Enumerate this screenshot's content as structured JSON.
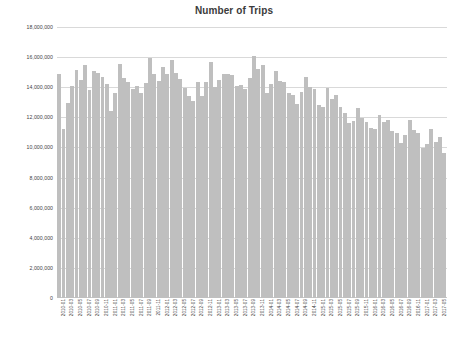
{
  "chart_data": {
    "type": "bar",
    "title": "Number of Trips",
    "xlabel": "",
    "ylabel": "",
    "ylim": [
      0,
      18000000
    ],
    "grid": true,
    "legend": null,
    "y_ticks": [
      "18,000,000",
      "16,000,000",
      "14,000,000",
      "12,000,000",
      "10,000,000",
      "8,000,000",
      "6,000,000",
      "4,000,000",
      "2,000,000",
      "0"
    ],
    "y_tick_values": [
      18000000,
      16000000,
      14000000,
      12000000,
      10000000,
      8000000,
      6000000,
      4000000,
      2000000,
      0
    ],
    "x_tick_labels": [
      "2010-01",
      "2010-03",
      "2010-05",
      "2010-07",
      "2010-09",
      "2010-11",
      "2011-01",
      "2011-03",
      "2011-05",
      "2011-07",
      "2011-09",
      "2011-11",
      "2012-01",
      "2012-03",
      "2012-05",
      "2012-07",
      "2012-09",
      "2012-11",
      "2013-01",
      "2013-03",
      "2013-05",
      "2013-07",
      "2013-09",
      "2013-11",
      "2014-01",
      "2014-03",
      "2014-05",
      "2014-07",
      "2014-09",
      "2014-11",
      "2015-01",
      "2015-03",
      "2015-05",
      "2015-07",
      "2015-09",
      "2015-11",
      "2016-01",
      "2016-03",
      "2016-05",
      "2016-07",
      "2016-09",
      "2016-11",
      "2017-01",
      "2017-03",
      "2017-05"
    ],
    "x_tick_interval_months": 2,
    "categories": [
      "2010-01",
      "2010-02",
      "2010-03",
      "2010-04",
      "2010-05",
      "2010-06",
      "2010-07",
      "2010-08",
      "2010-09",
      "2010-10",
      "2010-11",
      "2010-12",
      "2011-01",
      "2011-02",
      "2011-03",
      "2011-04",
      "2011-05",
      "2011-06",
      "2011-07",
      "2011-08",
      "2011-09",
      "2011-10",
      "2011-11",
      "2011-12",
      "2012-01",
      "2012-02",
      "2012-03",
      "2012-04",
      "2012-05",
      "2012-06",
      "2012-07",
      "2012-08",
      "2012-09",
      "2012-10",
      "2012-11",
      "2012-12",
      "2013-01",
      "2013-02",
      "2013-03",
      "2013-04",
      "2013-05",
      "2013-06",
      "2013-07",
      "2013-08",
      "2013-09",
      "2013-10",
      "2013-11",
      "2013-12",
      "2014-01",
      "2014-02",
      "2014-03",
      "2014-04",
      "2014-05",
      "2014-06",
      "2014-07",
      "2014-08",
      "2014-09",
      "2014-10",
      "2014-11",
      "2014-12",
      "2015-01",
      "2015-02",
      "2015-03",
      "2015-04",
      "2015-05",
      "2015-06",
      "2015-07",
      "2015-08",
      "2015-09",
      "2015-10",
      "2015-11",
      "2015-12",
      "2016-01",
      "2016-02",
      "2016-03",
      "2016-04",
      "2016-05",
      "2016-06",
      "2016-07",
      "2016-08",
      "2016-09",
      "2016-10",
      "2016-11",
      "2016-12",
      "2017-01",
      "2017-02",
      "2017-03",
      "2017-04",
      "2017-05",
      "2017-06"
    ],
    "values": [
      14900000,
      11200000,
      12950000,
      14050000,
      15150000,
      14500000,
      15500000,
      13800000,
      15050000,
      14950000,
      14650000,
      14200000,
      12450000,
      13650000,
      15550000,
      14600000,
      14350000,
      13900000,
      14050000,
      13650000,
      14250000,
      15950000,
      14900000,
      14400000,
      15350000,
      14900000,
      15800000,
      14950000,
      14550000,
      13950000,
      13400000,
      13100000,
      14350000,
      13400000,
      14350000,
      15700000,
      14000000,
      14450000,
      14900000,
      14900000,
      14800000,
      14100000,
      14150000,
      13850000,
      14600000,
      16050000,
      15200000,
      15450000,
      13600000,
      14200000,
      15050000,
      14400000,
      14350000,
      13650000,
      13500000,
      12900000,
      13700000,
      14650000,
      14000000,
      13850000,
      12800000,
      12700000,
      13950000,
      13250000,
      13500000,
      12700000,
      12300000,
      11600000,
      11750000,
      12600000,
      11950000,
      11700000,
      11300000,
      11250000,
      12150000,
      11700000,
      11850000,
      11100000,
      10950000,
      10300000,
      10850000,
      11800000,
      11150000,
      10950000,
      9950000,
      10250000,
      11200000,
      10350000,
      10700000,
      9600000
    ]
  }
}
